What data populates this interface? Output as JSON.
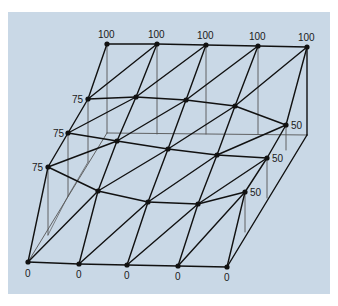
{
  "figure": {
    "type": "finite-element triangular mesh with nodal boundary values",
    "background_color": "#c9d8e6",
    "line_color": "#111111",
    "hidden_line_color": "#555555",
    "rows": [
      {
        "name": "top-edge",
        "values": [
          "100",
          "100",
          "100",
          "100",
          "100"
        ],
        "labeled": [
          true,
          true,
          true,
          true,
          true
        ]
      },
      {
        "name": "row-2",
        "values": [
          "75",
          "",
          "",
          "",
          "50"
        ],
        "labeled": [
          true,
          false,
          false,
          false,
          true
        ]
      },
      {
        "name": "row-3",
        "values": [
          "75",
          "",
          "",
          "",
          "50"
        ],
        "labeled": [
          true,
          false,
          false,
          false,
          true
        ]
      },
      {
        "name": "row-4",
        "values": [
          "75",
          "",
          "",
          "",
          "50"
        ],
        "labeled": [
          true,
          false,
          false,
          false,
          true
        ]
      },
      {
        "name": "bottom-edge",
        "values": [
          "0",
          "0",
          "0",
          "0",
          "0"
        ],
        "labeled": [
          true,
          true,
          true,
          true,
          true
        ]
      }
    ],
    "labels": {
      "top": [
        "100",
        "100",
        "100",
        "100",
        "100"
      ],
      "left": [
        "75",
        "75",
        "75"
      ],
      "right": [
        "50",
        "50",
        "50"
      ],
      "bottom": [
        "0",
        "0",
        "0",
        "0",
        "0"
      ]
    }
  }
}
